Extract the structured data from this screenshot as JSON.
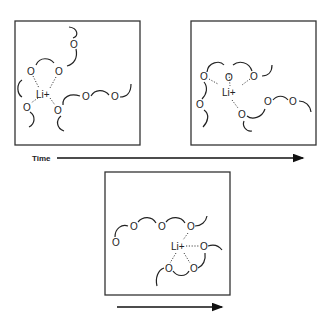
{
  "figure": {
    "panels": [
      {
        "id": "panel-1",
        "ion_label": "Li+",
        "oxygen_label": "O"
      },
      {
        "id": "panel-2",
        "ion_label": "Li+",
        "oxygen_label": "O"
      },
      {
        "id": "panel-3",
        "ion_label": "Li+",
        "oxygen_label": "O"
      }
    ],
    "time_axis": {
      "label": "Time"
    }
  }
}
